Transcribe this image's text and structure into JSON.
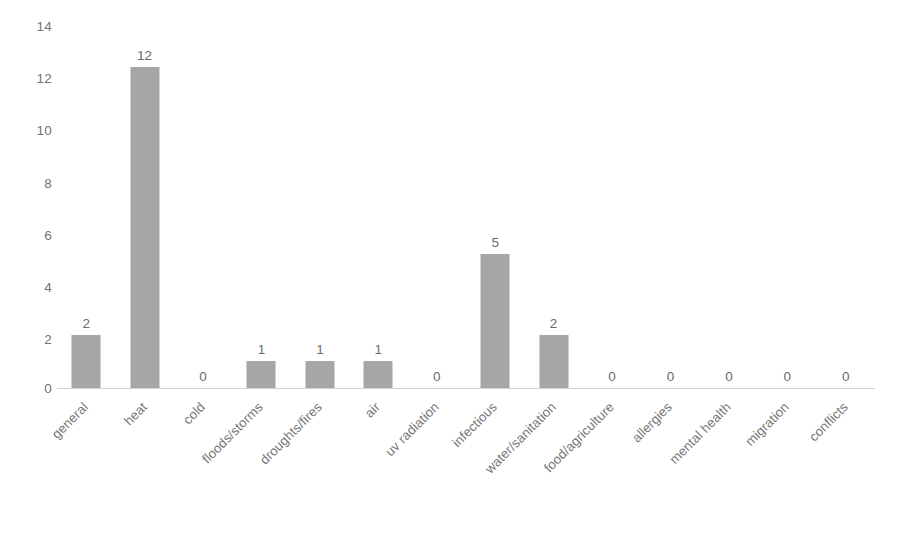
{
  "chart_data": {
    "type": "bar",
    "title": "",
    "subtitle": "",
    "xlabel": "",
    "ylabel": "",
    "ylim": [
      0,
      14
    ],
    "y_ticks": [
      0,
      2,
      4,
      6,
      8,
      10,
      12,
      14
    ],
    "y_tick_labels": [
      "0",
      "2",
      "4",
      "6",
      "8",
      "10",
      "12",
      "14"
    ],
    "grid": false,
    "legend": false,
    "legend_position": "none",
    "bar_color": "#a6a6a6",
    "axis_color": "#d4d4d4",
    "text_color": "#767676",
    "data_labels_shown": true,
    "categories": [
      "general",
      "heat",
      "cold",
      "floods/storms",
      "droughts/fires",
      "air",
      "uv radiation",
      "infectious",
      "water/sanitation",
      "food/agriculture",
      "allergies",
      "mental health",
      "migration",
      "conflicts"
    ],
    "values": [
      2,
      12,
      0,
      1,
      1,
      1,
      0,
      5,
      2,
      0,
      0,
      0,
      0,
      0
    ],
    "value_labels": [
      "2",
      "12",
      "0",
      "1",
      "1",
      "1",
      "0",
      "5",
      "2",
      "0",
      "0",
      "0",
      "0",
      "0"
    ]
  }
}
